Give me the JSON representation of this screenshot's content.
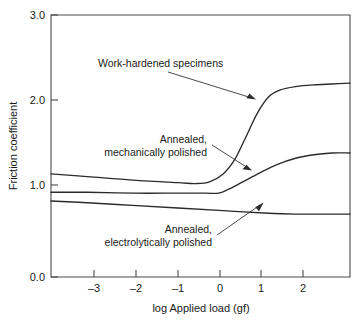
{
  "chart_data": {
    "type": "line",
    "title": "",
    "xlabel": "log Applied load (gf)",
    "ylabel": "Friction coefficient",
    "xlim": [
      -3.8,
      2.8
    ],
    "ylim": [
      0.0,
      3.0
    ],
    "xticks": [
      -3,
      -2,
      -1,
      0,
      1,
      2
    ],
    "xtick_labels": [
      "–3",
      "–2",
      "–1",
      "0",
      "1",
      "2"
    ],
    "yticks": [
      0.0,
      1.0,
      2.0,
      3.0
    ],
    "ytick_labels": [
      "0.0",
      "1.0",
      "2.0",
      "3.0"
    ],
    "grid": false,
    "legend": "annotations-with-arrows",
    "series": [
      {
        "name": "Work-hardened specimens",
        "x": [
          -3.8,
          -3.0,
          -2.0,
          -1.0,
          -0.6,
          -0.3,
          0.0,
          0.25,
          0.5,
          0.75,
          1.0,
          1.25,
          1.6,
          2.0,
          2.4,
          2.8
        ],
        "y": [
          1.18,
          1.15,
          1.11,
          1.08,
          1.07,
          1.09,
          1.18,
          1.34,
          1.6,
          1.87,
          2.06,
          2.14,
          2.18,
          2.2,
          2.21,
          2.22
        ]
      },
      {
        "name": "Annealed, mechanically polished",
        "x": [
          -3.8,
          -3.0,
          -2.0,
          -1.0,
          -0.4,
          -0.1,
          0.1,
          0.4,
          0.8,
          1.2,
          1.6,
          2.0,
          2.4,
          2.8
        ],
        "y": [
          0.97,
          0.97,
          0.96,
          0.96,
          0.96,
          0.96,
          1.0,
          1.08,
          1.19,
          1.29,
          1.36,
          1.4,
          1.42,
          1.42
        ]
      },
      {
        "name": "Annealed, electrolytically polished",
        "x": [
          -3.8,
          -3.0,
          -2.0,
          -1.0,
          0.0,
          1.0,
          1.6,
          2.0,
          2.4,
          2.8
        ],
        "y": [
          0.87,
          0.85,
          0.82,
          0.79,
          0.76,
          0.73,
          0.72,
          0.72,
          0.72,
          0.72
        ]
      }
    ],
    "annotations": [
      {
        "id": "work-hardened",
        "lines": [
          "Work-hardened specimens"
        ],
        "target_x": 1.0,
        "target_y": 2.06
      },
      {
        "id": "annealed-mechanical",
        "lines": [
          "Annealed,",
          "mechanically polished"
        ],
        "target_x": 0.75,
        "target_y": 1.17
      },
      {
        "id": "annealed-electrolytic",
        "lines": [
          "Annealed,",
          "electrolytically polished"
        ],
        "target_x": 1.0,
        "target_y": 0.73
      }
    ]
  },
  "axes": {
    "y_title": "Friction coefficient",
    "x_title": "log Applied load (gf)",
    "y_labels": {
      "t0": "0.0",
      "t1": "1.0",
      "t2": "2.0",
      "t3": "3.0"
    },
    "x_labels": {
      "t0": "–3",
      "t1": "–2",
      "t2": "–1",
      "t3": "0",
      "t4": "1",
      "t5": "2"
    }
  },
  "annotations": {
    "a1_line1": "Work-hardened specimens",
    "a2_line1": "Annealed,",
    "a2_line2": "mechanically polished",
    "a3_line1": "Annealed,",
    "a3_line2": "electrolytically polished"
  },
  "colors": {
    "curve": "#2b2b2b",
    "axis": "#4a4a4a",
    "text": "#1a1a1a",
    "background": "#ffffff"
  }
}
